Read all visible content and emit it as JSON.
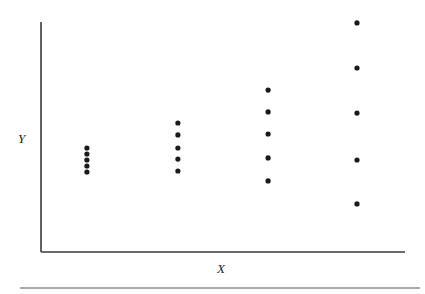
{
  "chart_data": {
    "type": "scatter",
    "title": "",
    "xlabel": "X",
    "ylabel": "Y",
    "xlim": [
      0,
      100
    ],
    "ylim": [
      0,
      100
    ],
    "grid": false,
    "legend": null,
    "ticks": {
      "x": [],
      "y": []
    },
    "annotations": [],
    "series": [
      {
        "name": "group-1",
        "x": [
          12.6,
          12.6,
          12.6,
          12.6,
          12.6
        ],
        "y": [
          45.2,
          42.6,
          40.0,
          37.4,
          34.8
        ]
      },
      {
        "name": "group-2",
        "x": [
          37.6,
          37.6,
          37.6,
          37.6,
          37.6
        ],
        "y": [
          56.1,
          50.9,
          45.2,
          40.4,
          35.2
        ]
      },
      {
        "name": "group-3",
        "x": [
          62.4,
          62.4,
          62.4,
          62.4,
          62.4
        ],
        "y": [
          70.4,
          60.9,
          51.3,
          40.9,
          30.9
        ]
      },
      {
        "name": "group-4",
        "x": [
          86.8,
          86.8,
          86.8,
          86.8,
          86.8
        ],
        "y": [
          99.6,
          80.0,
          60.4,
          40.0,
          20.9
        ]
      }
    ]
  },
  "colors": {
    "axis": "#3a3a3a",
    "point": "#1a1a1a",
    "rule": "#555555"
  },
  "layout": {
    "plot": {
      "left": 41,
      "top": 22,
      "right": 405,
      "bottom": 252
    },
    "rule_y": 288,
    "rule_x1": 20,
    "rule_x2": 420,
    "point_radius": 2.6
  }
}
